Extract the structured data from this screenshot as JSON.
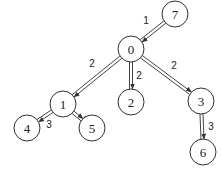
{
  "diagram": {
    "type": "tree",
    "nodes": [
      {
        "id": "7",
        "label": "7",
        "x": 175,
        "y": 14
      },
      {
        "id": "0",
        "label": "0",
        "x": 131,
        "y": 49
      },
      {
        "id": "1",
        "label": "1",
        "x": 63,
        "y": 104
      },
      {
        "id": "2",
        "label": "2",
        "x": 131,
        "y": 102
      },
      {
        "id": "3",
        "label": "3",
        "x": 201,
        "y": 101
      },
      {
        "id": "4",
        "label": "4",
        "x": 27,
        "y": 128
      },
      {
        "id": "5",
        "label": "5",
        "x": 92,
        "y": 128
      },
      {
        "id": "6",
        "label": "6",
        "x": 203,
        "y": 152
      }
    ],
    "edges": [
      {
        "from": "7",
        "to": "0",
        "weight": "1",
        "lx": 146,
        "ly": 20
      },
      {
        "from": "0",
        "to": "1",
        "weight": "2",
        "lx": 92,
        "ly": 63
      },
      {
        "from": "0",
        "to": "2",
        "weight": "2",
        "lx": 139,
        "ly": 75
      },
      {
        "from": "0",
        "to": "3",
        "weight": "2",
        "lx": 174,
        "ly": 65
      },
      {
        "from": "1",
        "to": "4",
        "weight": "3",
        "lx": 49,
        "ly": 124
      },
      {
        "from": "1",
        "to": "5",
        "weight": "3",
        "lx": 86,
        "ly": 120
      },
      {
        "from": "3",
        "to": "6",
        "weight": "3",
        "lx": 211,
        "ly": 126
      }
    ],
    "node_radius": 13
  }
}
